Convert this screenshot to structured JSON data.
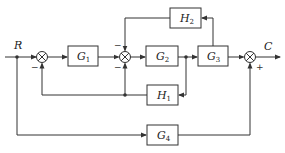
{
  "diagram": {
    "type": "control-system block diagram",
    "input": {
      "label": "R"
    },
    "output": {
      "label": "C"
    },
    "blocks": [
      {
        "id": "G1",
        "base": "G",
        "sub": "1"
      },
      {
        "id": "G2",
        "base": "G",
        "sub": "2"
      },
      {
        "id": "G3",
        "base": "G",
        "sub": "3"
      },
      {
        "id": "G4",
        "base": "G",
        "sub": "4"
      },
      {
        "id": "H1",
        "base": "H",
        "sub": "1"
      },
      {
        "id": "H2",
        "base": "H",
        "sub": "2"
      }
    ],
    "summing_junctions": [
      {
        "id": "S1",
        "signs": {
          "bottom": "−"
        }
      },
      {
        "id": "S2",
        "signs": {
          "top": "−",
          "bottom": "−"
        }
      },
      {
        "id": "S3",
        "signs": {
          "bottom": "+"
        }
      }
    ],
    "connections": [
      "R → S1",
      "S1 → G1",
      "G1 → S2",
      "S2 → G2",
      "G2 → G3",
      "G3 → S3",
      "S3 → C",
      "G3 output → H2 → S2 (top, −)",
      "G2 output → H1 → S1 (bottom, −) and S2 (bottom, −)",
      "R → G4 → S3 (bottom, +)"
    ]
  }
}
